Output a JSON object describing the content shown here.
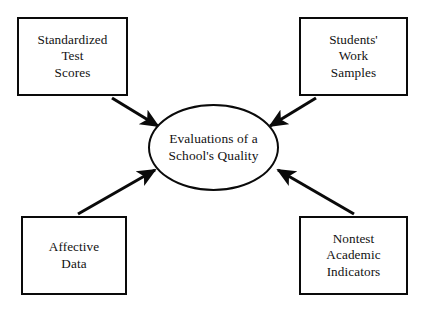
{
  "canvas": {
    "width": 427,
    "height": 311,
    "background": "#ffffff",
    "stroke_color": "#0a0a0a",
    "text_color": "#111111"
  },
  "diagram": {
    "center": {
      "shape": "ellipse",
      "label": "Evaluations of a\nSchool's Quality"
    },
    "sources": [
      {
        "id": "standardized-test-scores",
        "label": "Standardized\nTest\nScores",
        "position": "top-left",
        "shape": "rectangle"
      },
      {
        "id": "students-work-samples",
        "label": "Students'\nWork\nSamples",
        "position": "top-right",
        "shape": "rectangle"
      },
      {
        "id": "affective-data",
        "label": "Affective\nData",
        "position": "bottom-left",
        "shape": "rectangle"
      },
      {
        "id": "nontest-academic-indicators",
        "label": "Nontest\nAcademic\nIndicators",
        "position": "bottom-right",
        "shape": "rectangle"
      }
    ],
    "connectors": [
      {
        "id": "arrow-top-left-to-center",
        "from": "standardized-test-scores",
        "to": "center",
        "style": "solid-filled-arrowhead"
      },
      {
        "id": "arrow-top-right-to-center",
        "from": "students-work-samples",
        "to": "center",
        "style": "solid-filled-arrowhead"
      },
      {
        "id": "arrow-bottom-left-to-center",
        "from": "affective-data",
        "to": "center",
        "style": "solid-filled-arrowhead"
      },
      {
        "id": "arrow-bottom-right-to-center",
        "from": "nontest-academic-indicators",
        "to": "center",
        "style": "solid-filled-arrowhead"
      }
    ]
  }
}
